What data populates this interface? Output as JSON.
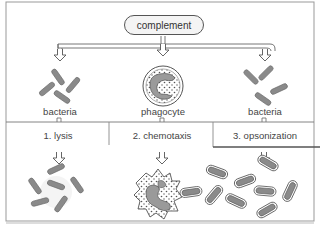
{
  "diagram": {
    "source_node": "complement",
    "targets": [
      {
        "label": "bacteria",
        "icon": "bacteria-cluster-icon"
      },
      {
        "label": "phagocyte",
        "icon": "phagocyte-cell-icon"
      },
      {
        "label": "bacteria",
        "icon": "bacteria-cluster-icon"
      }
    ],
    "processes": [
      {
        "label": "1. lysis",
        "result_icon": "lysed-bacteria-icon"
      },
      {
        "label": "2. chemotaxis",
        "result_icon": "phagocyte-engulfing-icon"
      },
      {
        "label": "3. opsonization",
        "result_icon": "opsonized-bacteria-icon"
      }
    ],
    "colors": {
      "bacteria_fill": "#8a8a8a",
      "outline": "#555555",
      "border": "#888888",
      "background": "#ffffff"
    }
  }
}
